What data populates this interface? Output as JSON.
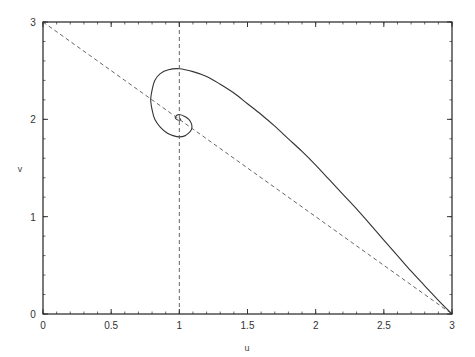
{
  "chart_data": {
    "type": "line",
    "title": "",
    "xlabel": "u",
    "ylabel": "v",
    "xlim": [
      0,
      3
    ],
    "ylim": [
      0,
      3
    ],
    "grid": false,
    "legend": null,
    "x_ticks": [
      0,
      0.5,
      1,
      1.5,
      2,
      2.5,
      3
    ],
    "x_tick_labels": [
      "0",
      "0.5",
      "1",
      "1.5",
      "2",
      "2.5",
      "3"
    ],
    "y_ticks": [
      0,
      1,
      2,
      3
    ],
    "y_tick_labels": [
      "0",
      "1",
      "2",
      "3"
    ],
    "x_minor_step": 0.1,
    "y_minor_step": 0.2,
    "series": [
      {
        "name": "trajectory",
        "style": "solid",
        "color": "#333333",
        "points": [
          [
            3.0,
            0.0
          ],
          [
            2.9,
            0.14
          ],
          [
            2.8,
            0.29
          ],
          [
            2.7,
            0.44
          ],
          [
            2.6,
            0.6
          ],
          [
            2.5,
            0.76
          ],
          [
            2.4,
            0.92
          ],
          [
            2.3,
            1.08
          ],
          [
            2.2,
            1.23
          ],
          [
            2.1,
            1.38
          ],
          [
            2.0,
            1.53
          ],
          [
            1.9,
            1.67
          ],
          [
            1.8,
            1.8
          ],
          [
            1.7,
            1.93
          ],
          [
            1.6,
            2.05
          ],
          [
            1.5,
            2.16
          ],
          [
            1.4,
            2.27
          ],
          [
            1.3,
            2.36
          ],
          [
            1.2,
            2.44
          ],
          [
            1.1,
            2.49
          ],
          [
            1.0,
            2.52
          ],
          [
            0.92,
            2.51
          ],
          [
            0.86,
            2.47
          ],
          [
            0.82,
            2.4
          ],
          [
            0.8,
            2.3
          ],
          [
            0.79,
            2.2
          ],
          [
            0.8,
            2.1
          ],
          [
            0.82,
            2.0
          ],
          [
            0.86,
            1.92
          ],
          [
            0.91,
            1.86
          ],
          [
            0.96,
            1.83
          ],
          [
            1.0,
            1.82
          ],
          [
            1.04,
            1.83
          ],
          [
            1.07,
            1.86
          ],
          [
            1.09,
            1.9
          ],
          [
            1.09,
            1.95
          ],
          [
            1.07,
            2.0
          ],
          [
            1.04,
            2.03
          ],
          [
            1.0,
            2.05
          ],
          [
            0.98,
            2.04
          ],
          [
            0.97,
            2.02
          ],
          [
            0.98,
            2.0
          ],
          [
            1.0,
            1.99
          ],
          [
            1.01,
            2.0
          ],
          [
            1.0,
            2.01
          ]
        ]
      },
      {
        "name": "nullcline u=1",
        "style": "dashed",
        "color": "#555555",
        "points": [
          [
            1,
            0
          ],
          [
            1,
            3
          ]
        ]
      },
      {
        "name": "nullcline u+v=3",
        "style": "dashed",
        "color": "#555555",
        "points": [
          [
            0,
            3
          ],
          [
            3,
            0
          ]
        ]
      }
    ]
  },
  "layout": {
    "plot_left": 43,
    "plot_right": 452,
    "plot_top": 22,
    "plot_bottom": 314,
    "axis_color": "#222222"
  }
}
